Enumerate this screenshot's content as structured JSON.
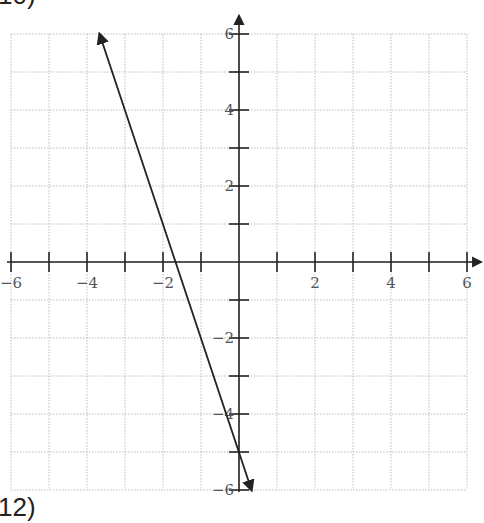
{
  "problem_labels": {
    "top": "10)",
    "bottom": "12)"
  },
  "chart_data": {
    "type": "line",
    "title": "",
    "xlabel": "",
    "ylabel": "",
    "xlim": [
      -6,
      6
    ],
    "ylim": [
      -6,
      6
    ],
    "grid": true,
    "grid_step": 1,
    "x_tick_labels": [
      "-6",
      "-4",
      "-2",
      "2",
      "4",
      "6"
    ],
    "y_tick_labels": [
      "6",
      "4",
      "2",
      "-2",
      "-4",
      "-6"
    ],
    "x_tick_values": [
      -6,
      -4,
      -2,
      2,
      4,
      6
    ],
    "y_tick_values": [
      6,
      4,
      2,
      -2,
      -4,
      -6
    ],
    "series": [
      {
        "name": "line",
        "equation": "y = -3x - 5",
        "slope": -3,
        "intercept": -5,
        "x": [
          -3.67,
          0.33
        ],
        "y": [
          6,
          -6
        ],
        "arrows": "both"
      }
    ]
  },
  "colors": {
    "grid": "#bdbdbd",
    "axis": "#222222",
    "line": "#222222",
    "tick_label": "#555555"
  },
  "layout": {
    "origin_px": [
      239,
      262
    ],
    "unit_px": 38
  }
}
